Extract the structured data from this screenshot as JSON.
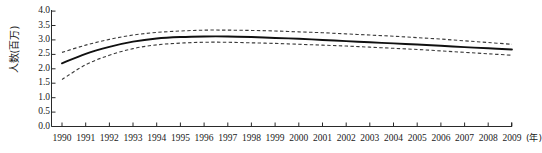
{
  "chart_data": {
    "type": "line",
    "title": "",
    "xlabel": "(年)",
    "ylabel": "人数(百万)",
    "xlim": [
      1990,
      2009
    ],
    "ylim": [
      0.0,
      4.0
    ],
    "grid": false,
    "legend": null,
    "x": [
      1990,
      1991,
      1992,
      1993,
      1994,
      1995,
      1996,
      1997,
      1998,
      1999,
      2000,
      2001,
      2002,
      2003,
      2004,
      2005,
      2006,
      2007,
      2008,
      2009
    ],
    "yticks": [
      "0.0",
      "0.5",
      "1.0",
      "1.5",
      "2.0",
      "2.5",
      "3.0",
      "3.5",
      "4.0"
    ],
    "ytick_values": [
      0.0,
      0.5,
      1.0,
      1.5,
      2.0,
      2.5,
      3.0,
      3.5,
      4.0
    ],
    "xticks": [
      "1990",
      "1991",
      "1992",
      "1993",
      "1994",
      "1995",
      "1996",
      "1997",
      "1998",
      "1999",
      "2000",
      "2001",
      "2002",
      "2003",
      "2004",
      "2005",
      "2006",
      "2007",
      "2008",
      "2009"
    ],
    "series": [
      {
        "name": "估计值",
        "style": "solid",
        "color": "#101010",
        "values": [
          2.19,
          2.52,
          2.76,
          2.94,
          3.05,
          3.1,
          3.12,
          3.12,
          3.1,
          3.07,
          3.04,
          3.0,
          2.96,
          2.92,
          2.88,
          2.84,
          2.8,
          2.75,
          2.71,
          2.67
        ]
      },
      {
        "name": "置信区间上限",
        "style": "dashed",
        "color": "#3a3a3a",
        "values": [
          2.57,
          2.82,
          3.02,
          3.17,
          3.26,
          3.31,
          3.34,
          3.34,
          3.33,
          3.31,
          3.28,
          3.25,
          3.21,
          3.17,
          3.13,
          3.08,
          3.03,
          2.97,
          2.91,
          2.85
        ]
      },
      {
        "name": "置信区间下限",
        "style": "dashed",
        "color": "#3a3a3a",
        "values": [
          1.63,
          2.14,
          2.47,
          2.7,
          2.83,
          2.89,
          2.92,
          2.92,
          2.9,
          2.88,
          2.85,
          2.82,
          2.79,
          2.75,
          2.71,
          2.67,
          2.62,
          2.57,
          2.52,
          2.47
        ]
      }
    ]
  }
}
